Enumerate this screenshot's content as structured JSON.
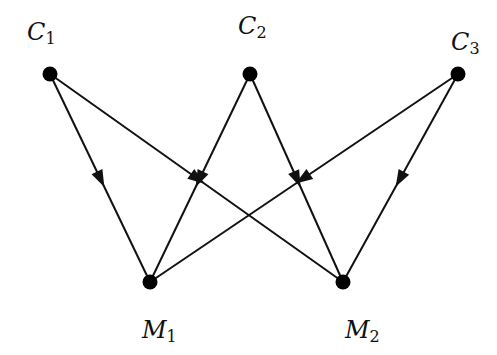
{
  "diagram": {
    "type": "bipartite directed graph",
    "colors": {
      "line": "#111111",
      "node": "#000000",
      "background": "#ffffff"
    },
    "nodes": [
      {
        "id": "C1",
        "letter": "C",
        "sub": "1",
        "x": 50,
        "y": 74,
        "label_x": 27,
        "label_y": 20
      },
      {
        "id": "C2",
        "letter": "C",
        "sub": "2",
        "x": 250,
        "y": 74,
        "label_x": 238,
        "label_y": 14
      },
      {
        "id": "C3",
        "letter": "C",
        "sub": "3",
        "x": 458,
        "y": 74,
        "label_x": 451,
        "label_y": 30
      },
      {
        "id": "M1",
        "letter": "M",
        "sub": "1",
        "x": 150,
        "y": 282,
        "label_x": 142,
        "label_y": 318
      },
      {
        "id": "M2",
        "letter": "M",
        "sub": "2",
        "x": 343,
        "y": 282,
        "label_x": 345,
        "label_y": 318
      }
    ],
    "edges": [
      {
        "from": "C1",
        "to": "M1"
      },
      {
        "from": "C1",
        "to": "M2"
      },
      {
        "from": "C2",
        "to": "M1"
      },
      {
        "from": "C2",
        "to": "M2"
      },
      {
        "from": "C3",
        "to": "M1"
      },
      {
        "from": "C3",
        "to": "M2"
      }
    ]
  }
}
